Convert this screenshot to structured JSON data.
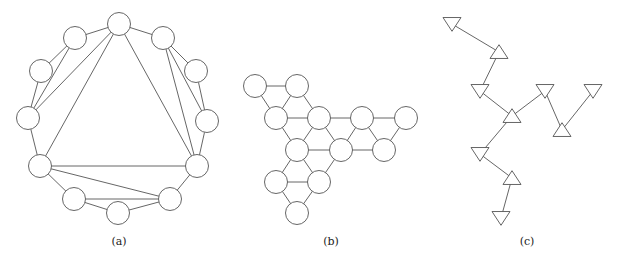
{
  "panels": [
    {
      "id": "a",
      "caption": "(a)",
      "caption_pos": [
        119,
        245
      ],
      "shape": "circle",
      "radius": 11.5,
      "nodes": [
        [
          119,
          24
        ],
        [
          163,
          38
        ],
        [
          196,
          71
        ],
        [
          207,
          121
        ],
        [
          197,
          166
        ],
        [
          170,
          199
        ],
        [
          118,
          213
        ],
        [
          74,
          199
        ],
        [
          40,
          166
        ],
        [
          28,
          118
        ],
        [
          41,
          71
        ],
        [
          75,
          38
        ]
      ],
      "edges": [
        [
          0,
          1
        ],
        [
          1,
          2
        ],
        [
          2,
          3
        ],
        [
          3,
          4
        ],
        [
          4,
          5
        ],
        [
          5,
          6
        ],
        [
          6,
          7
        ],
        [
          7,
          8
        ],
        [
          8,
          9
        ],
        [
          9,
          10
        ],
        [
          10,
          11
        ],
        [
          11,
          0
        ],
        [
          0,
          9
        ],
        [
          11,
          9
        ],
        [
          0,
          8
        ],
        [
          0,
          4
        ],
        [
          1,
          4
        ],
        [
          1,
          3
        ],
        [
          8,
          4
        ],
        [
          8,
          5
        ],
        [
          7,
          5
        ]
      ]
    },
    {
      "id": "b",
      "caption": "(b)",
      "caption_pos": [
        331,
        245
      ],
      "shape": "circle",
      "radius": 11.5,
      "nodes": [
        [
          255,
          86
        ],
        [
          297,
          86
        ],
        [
          276,
          118
        ],
        [
          319,
          118
        ],
        [
          362,
          118
        ],
        [
          406,
          118
        ],
        [
          297,
          150
        ],
        [
          341,
          150
        ],
        [
          384,
          150
        ],
        [
          276,
          182
        ],
        [
          319,
          182
        ],
        [
          297,
          213
        ]
      ],
      "edges": [
        [
          0,
          1
        ],
        [
          0,
          2
        ],
        [
          1,
          2
        ],
        [
          1,
          3
        ],
        [
          2,
          3
        ],
        [
          3,
          4
        ],
        [
          4,
          5
        ],
        [
          2,
          6
        ],
        [
          3,
          6
        ],
        [
          3,
          7
        ],
        [
          4,
          7
        ],
        [
          4,
          8
        ],
        [
          5,
          8
        ],
        [
          6,
          7
        ],
        [
          7,
          8
        ],
        [
          6,
          9
        ],
        [
          6,
          10
        ],
        [
          7,
          10
        ],
        [
          9,
          10
        ],
        [
          9,
          11
        ],
        [
          10,
          11
        ]
      ]
    },
    {
      "id": "c",
      "caption": "(c)",
      "caption_pos": [
        527,
        245
      ],
      "shape": "triangle",
      "size": 9,
      "nodes": [
        {
          "x": 452,
          "y": 24,
          "dir": "down"
        },
        {
          "x": 499,
          "y": 52,
          "dir": "up"
        },
        {
          "x": 480,
          "y": 91,
          "dir": "down"
        },
        {
          "x": 512,
          "y": 116,
          "dir": "up"
        },
        {
          "x": 545,
          "y": 91,
          "dir": "down"
        },
        {
          "x": 593,
          "y": 91,
          "dir": "down"
        },
        {
          "x": 562,
          "y": 130,
          "dir": "up"
        },
        {
          "x": 480,
          "y": 154,
          "dir": "down"
        },
        {
          "x": 512,
          "y": 178,
          "dir": "up"
        },
        {
          "x": 501,
          "y": 218,
          "dir": "down"
        }
      ],
      "edges": [
        [
          0,
          1
        ],
        [
          1,
          2
        ],
        [
          2,
          3
        ],
        [
          3,
          4
        ],
        [
          4,
          6
        ],
        [
          6,
          5
        ],
        [
          3,
          7
        ],
        [
          7,
          8
        ],
        [
          8,
          9
        ]
      ]
    }
  ]
}
